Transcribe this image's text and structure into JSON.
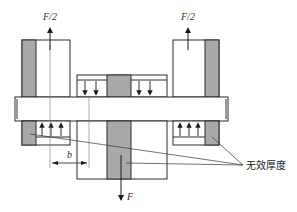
{
  "diagram": {
    "type": "mechanical-connection-cross-section",
    "labels": {
      "force_left_top": "F/2",
      "force_right_top": "F/2",
      "force_bottom": "F",
      "dimension_b": "b",
      "ineffective_thickness": "无效厚度"
    },
    "colors": {
      "line": "#2a2a2a",
      "shade": "#a9a9a9",
      "bar_edge_shade": "#9a9a9a",
      "background": "#ffffff",
      "thin_line": "#555555"
    },
    "components": [
      {
        "id": "left-top-block",
        "desc": "upper left plate with shaded ineffective strip"
      },
      {
        "id": "right-top-block",
        "desc": "upper right plate with shaded ineffective strip"
      },
      {
        "id": "middle-top-plate",
        "desc": "central upper plate with shaded core and downward pressure arrows"
      },
      {
        "id": "horizontal-bar",
        "desc": "transverse pin/bar spanning all plates"
      },
      {
        "id": "left-bottom-block",
        "desc": "lower left bearing with upward pressure arrows"
      },
      {
        "id": "right-bottom-block",
        "desc": "lower right bearing with upward pressure arrows"
      },
      {
        "id": "bottom-central-block",
        "desc": "central lower plate with shaded core, loaded by F"
      }
    ]
  }
}
